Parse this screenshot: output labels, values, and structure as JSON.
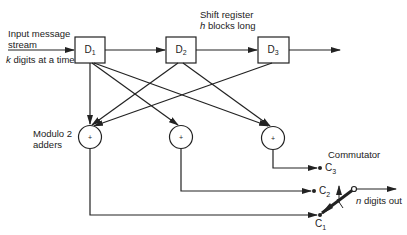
{
  "diagram": {
    "labels": {
      "input_line1": "Input message",
      "input_line2": "stream",
      "input_rate_var": "k",
      "input_rate_rest": " digits at a time",
      "shift_reg_line1": "Shift register",
      "shift_reg_var": "h",
      "shift_reg_rest": " blocks long",
      "adders_line1": "Modulo 2",
      "adders_line2": "adders",
      "commutator": "Commutator",
      "output_var": "n",
      "output_rest": " digits out"
    },
    "registers": [
      {
        "name": "D",
        "sub": "1"
      },
      {
        "name": "D",
        "sub": "2"
      },
      {
        "name": "D",
        "sub": "3"
      }
    ],
    "adders": [
      {
        "symbol": "+",
        "inputs": [
          "D1",
          "D2",
          "D3"
        ],
        "output": "C1"
      },
      {
        "symbol": "+",
        "inputs": [
          "D1"
        ],
        "output": "C2"
      },
      {
        "symbol": "+",
        "inputs": [
          "D1",
          "D2"
        ],
        "output": "C3"
      }
    ],
    "commutator_contacts": [
      {
        "name": "C",
        "sub": "3"
      },
      {
        "name": "C",
        "sub": "2"
      },
      {
        "name": "C",
        "sub": "1"
      }
    ],
    "colors": {
      "stroke": "#222222",
      "background": "#ffffff"
    }
  }
}
